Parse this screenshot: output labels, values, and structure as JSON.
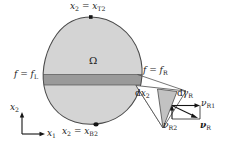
{
  "figure": {
    "domain_label": "Ω",
    "top_point_label_lhs": "x",
    "labels": {
      "top_boundary": {
        "lhs_var": "x",
        "lhs_sub": "2",
        "eq": "=",
        "rhs_var": "x",
        "rhs_sub": "T2",
        "full": "x2 = xT2"
      },
      "bottom_boundary": {
        "lhs_var": "x",
        "lhs_sub": "2",
        "eq": "=",
        "rhs_var": "x",
        "rhs_sub": "B2",
        "full": "x2 = xB2"
      },
      "left_flux": {
        "lhs_var": "f",
        "eq": "=",
        "rhs_var": "f",
        "rhs_sub": "L",
        "full": "f = fL"
      },
      "right_flux": {
        "lhs_var": "f",
        "eq": "=",
        "rhs_var": "f",
        "rhs_sub": "R",
        "full": "f = fR"
      },
      "dx2": {
        "prefix": "d",
        "var": "x",
        "sub": "2",
        "full": "dx2"
      },
      "dgamma_r": {
        "prefix": "d",
        "var": "γ",
        "sub": "R",
        "full": "dγR"
      },
      "nu_r1": {
        "var": "ν",
        "sub": "R1",
        "full": "νR1"
      },
      "nu_r2": {
        "var": "ν",
        "sub": "R2",
        "full": "νR2"
      },
      "nu_r": {
        "var": "ν",
        "sub": "R",
        "full": "νR"
      },
      "axis_x1": {
        "var": "x",
        "sub": "1",
        "full": "x1"
      },
      "axis_x2": {
        "var": "x",
        "sub": "2",
        "full": "x2"
      }
    },
    "colors": {
      "domain_fill": "#d4d4d4",
      "band_fill": "#9a9a9a",
      "wedge_fill": "#bfbfbf",
      "outline": "#3a3a3a",
      "text": "#1a1a1a",
      "background": "#ffffff"
    }
  }
}
